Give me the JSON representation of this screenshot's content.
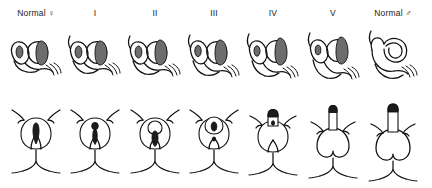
{
  "figure": {
    "name": "prader-virilization-scale",
    "background_color": "#ffffff",
    "ink_color": "#111111",
    "row_labels": {
      "top_row": "sagittal internal anatomy",
      "bottom_row": "external genitalia frontal view"
    },
    "columns": [
      {
        "id": "normal-female",
        "label": "Normal ♀",
        "sex_symbol": "female-symbol",
        "stage_index": 0
      },
      {
        "id": "stage-1",
        "label": "I",
        "sex_symbol": "",
        "stage_index": 1
      },
      {
        "id": "stage-2",
        "label": "II",
        "sex_symbol": "",
        "stage_index": 2
      },
      {
        "id": "stage-3",
        "label": "III",
        "sex_symbol": "",
        "stage_index": 3
      },
      {
        "id": "stage-4",
        "label": "IV",
        "sex_symbol": "",
        "stage_index": 4
      },
      {
        "id": "stage-5",
        "label": "V",
        "sex_symbol": "",
        "stage_index": 5
      },
      {
        "id": "normal-male",
        "label": "Normal ♂",
        "sex_symbol": "male-symbol",
        "stage_index": 6
      }
    ]
  }
}
